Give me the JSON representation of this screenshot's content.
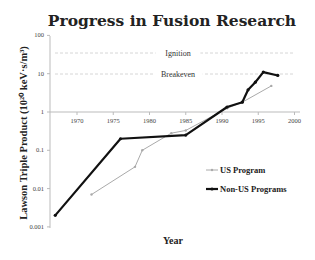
{
  "chart_data": {
    "type": "line",
    "title": "Progress in Fusion Research",
    "xlabel": "Year",
    "ylabel": "Lawson Triple Product (10^20 keV·s/m³)",
    "ylabel_display": "Lawson Triple Product (10²⁰ keV·s/m³)",
    "yscale": "log",
    "ylim": [
      0.001,
      100
    ],
    "xlim": [
      1966,
      2001
    ],
    "x_ticks": [
      "1970",
      "1975",
      "1980",
      "1985",
      "1990",
      "1995",
      "2000"
    ],
    "y_ticks": [
      "100",
      "10",
      "1",
      "0.1",
      "0.01",
      "0.001"
    ],
    "grid": false,
    "legend_position": "right-lower",
    "reference_lines": [
      {
        "label": "Ignition",
        "value": 40
      },
      {
        "label": "Breakeven",
        "value": 10
      }
    ],
    "series": [
      {
        "name": "US Program",
        "color": "#aaaaaa",
        "x": [
          1972,
          1978,
          1979,
          1983,
          1985,
          1990.7,
          1992.8,
          1996.8
        ],
        "values": [
          0.007,
          0.037,
          0.1,
          0.28,
          0.33,
          1.25,
          1.8,
          4.8
        ]
      },
      {
        "name": "Non-US Programs",
        "color": "#111111",
        "x": [
          1967,
          1976,
          1985,
          1990.7,
          1992.8,
          1993.6,
          1994.6,
          1995.7,
          1997.7
        ],
        "values": [
          0.002,
          0.2,
          0.25,
          1.35,
          1.8,
          3.8,
          6,
          11,
          9
        ]
      }
    ]
  }
}
